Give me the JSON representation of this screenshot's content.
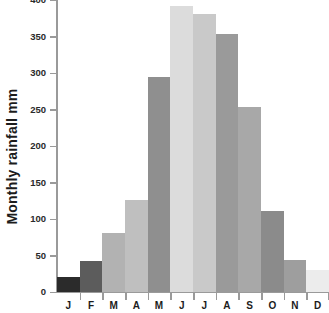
{
  "chart_data": {
    "type": "bar",
    "title": "",
    "xlabel": "",
    "ylabel": "Monthly rainfall mm",
    "categories": [
      "J",
      "F",
      "M",
      "A",
      "M",
      "J",
      "J",
      "A",
      "S",
      "O",
      "N",
      "D"
    ],
    "category_names": [
      "January",
      "February",
      "March",
      "April",
      "May",
      "June",
      "July",
      "August",
      "September",
      "October",
      "November",
      "December"
    ],
    "values": [
      20,
      42,
      81,
      126,
      294,
      392,
      381,
      354,
      254,
      111,
      44,
      30
    ],
    "ylim": [
      0,
      400
    ],
    "ytick_values": [
      0,
      50,
      100,
      150,
      200,
      250,
      300,
      350,
      400
    ],
    "ytick_labels": [
      "0",
      "50",
      "100",
      "150",
      "200",
      "250",
      "300",
      "350",
      "400"
    ],
    "grid": false,
    "legend": null,
    "bar_colors": [
      "#2b2b2b",
      "#5c5c5c",
      "#b2b2b2",
      "#bfbfbf",
      "#8f8f8f",
      "#dcdcdc",
      "#c9c9c9",
      "#9a9a9a",
      "#a8a8a8",
      "#8b8b8b",
      "#9e9e9e",
      "#ececec"
    ],
    "axis_color": "#9a9a9a",
    "text_color": "#1c1c1c",
    "background": "#ffffff"
  }
}
